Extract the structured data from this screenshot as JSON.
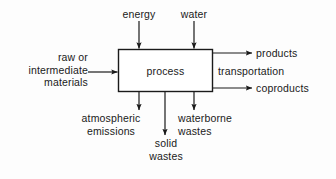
{
  "diagram": {
    "stroke_color": "#1a1a1a",
    "background_color": "#fdfdfd",
    "process_box": {
      "label": "process",
      "x": 118,
      "y": 49,
      "width": 95,
      "height": 43
    },
    "inputs": {
      "top": [
        {
          "id": "energy",
          "label": "energy",
          "arrow_x": 139
        },
        {
          "id": "water",
          "label": "water",
          "arrow_x": 194
        }
      ],
      "left": [
        {
          "id": "raw-intermediate-materials",
          "label": "raw  or\nintermediate\nmaterials",
          "line1": "raw  or",
          "line2": "intermediate",
          "line3": "materials",
          "arrow_y": 72
        }
      ]
    },
    "outputs": {
      "right": [
        {
          "id": "products",
          "label": "products",
          "arrow_y": 53,
          "has_arrow": true
        },
        {
          "id": "transportation",
          "label": "transportation",
          "arrow_y": 70,
          "has_arrow": false
        },
        {
          "id": "coproducts",
          "label": "coproducts",
          "arrow_y": 88,
          "has_arrow": true
        }
      ],
      "bottom": [
        {
          "id": "atmospheric-emissions",
          "line1": "atmospheric",
          "line2": "emissions",
          "arrow_x": 139
        },
        {
          "id": "solid-wastes",
          "line1": "solid",
          "line2": "wastes",
          "arrow_x": 165
        },
        {
          "id": "waterborne-wastes",
          "line1": "waterborne",
          "line2": "wastes",
          "arrow_x": 194
        }
      ]
    }
  }
}
